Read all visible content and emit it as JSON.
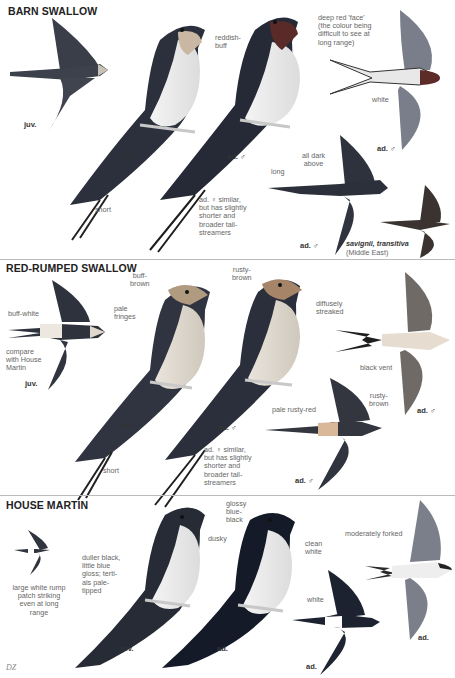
{
  "plate": {
    "species": [
      {
        "title": "BARN SWALLOW",
        "labels": {
          "reddish_buff": "reddish-\nbuff",
          "deep_red_face": "deep red 'face'\n(the colour being\ndifficult to see at\nlong range)",
          "white": "white",
          "short": "short",
          "female_note": "ad. ♀ similar,\nbut has slightly\nshorter and\nbroader tail-\nstreamers",
          "long": "long",
          "all_dark_above": "all dark\nabove",
          "savignii": "savignii, transitiva",
          "middle_east": "(Middle East)"
        },
        "ages": {
          "juv_flight": "juv.",
          "juv_perched": "juv.",
          "ad_male_perched": "ad. ♂",
          "ad_male_flight_top": "ad. ♂",
          "ad_male_flight_dark": "ad. ♂"
        }
      },
      {
        "title": "RED-RUMPED SWALLOW",
        "labels": {
          "buff_white": "buff-white",
          "compare": "compare\nwith House\nMartin",
          "buff_brown": "buff-\nbrown",
          "pale_fringes": "pale\nfringes",
          "rusty_brown_head": "rusty-\nbrown",
          "diffusely_streaked": "diffusely\nstreaked",
          "black_vent": "black vent",
          "short": "short",
          "female_note": "ad. ♀ similar,\nbut has slightly\nshorter and\nbroader tail-\nstreamers",
          "pale_rusty_red": "pale rusty-red",
          "rusty_brown_nape": "rusty-\nbrown"
        },
        "ages": {
          "juv_flight": "juv.",
          "juv_perched": "juv.",
          "ad_male_perched": "ad. ♂",
          "ad_male_flight_under": "ad. ♂",
          "ad_male_flight_top": "ad. ♂"
        }
      },
      {
        "title": "HOUSE MARTIN",
        "labels": {
          "rump_note": "large white rump\npatch striking\neven at long\nrange",
          "duller_black": "duller black,\nlittle blue\ngloss; terti-\nals pale-\ntipped",
          "dusky": "dusky",
          "glossy": "glossy\nblue-\nblack",
          "clean_white": "clean\nwhite",
          "moderately_forked": "moderately forked",
          "white": "white"
        },
        "ages": {
          "juv_perched": "juv.",
          "ad_perched": "ad.",
          "ad_flight_top": "ad.",
          "ad_flight_under": "ad."
        }
      }
    ],
    "signature": "DZ"
  }
}
